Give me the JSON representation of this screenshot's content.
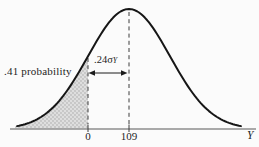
{
  "figure": {
    "probability_label": ".41 probability",
    "distance_label_main": ".24σ",
    "distance_label_sub": "Y",
    "tick_zero": "0",
    "tick_mean": "109",
    "axis_label": "Y"
  },
  "colors": {
    "curve": "#161616",
    "axis_line": "#8e8e8e",
    "dashed_lines": "#3c3c3c",
    "shade_base": "#dedede",
    "shade_dots": "#9e9e9e",
    "text": "#1e1e1e",
    "background": "#fbfbfb"
  },
  "chart_data": {
    "type": "area",
    "curve": "normal (Gaussian) bell curve",
    "x_tick_labels": [
      "0",
      "109"
    ],
    "xlabel": "Y",
    "peak_x_label": "109",
    "shaded_region": {
      "extent": "left tail of curve up to the vertical dashed line at 0",
      "area_label": ".41 probability",
      "probability": 0.41
    },
    "annotations": [
      {
        "type": "double-headed-arrow",
        "from_x_label": "0",
        "to_x_label": "109",
        "label": ".24σY",
        "distance_in_sd": 0.24
      }
    ],
    "grid": false,
    "legend": false
  }
}
